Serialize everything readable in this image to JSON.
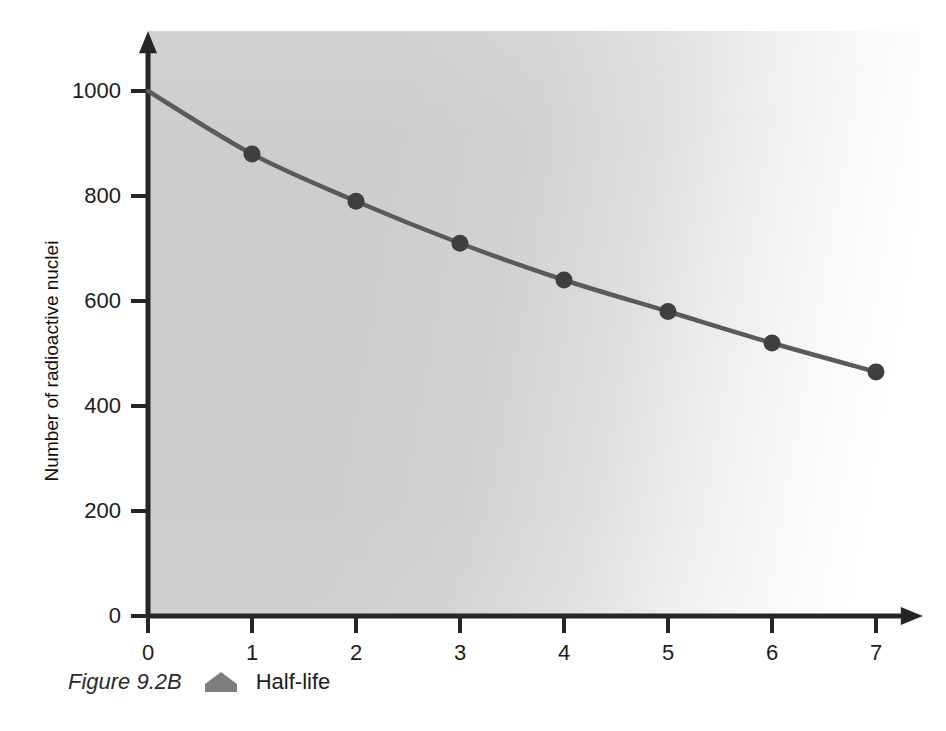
{
  "chart_data": {
    "type": "line",
    "title": "",
    "xlabel": "",
    "ylabel": "Number of radioactive nuclei",
    "x": [
      0,
      1,
      2,
      3,
      4,
      5,
      6,
      7
    ],
    "values": [
      1000,
      880,
      790,
      710,
      640,
      580,
      520,
      465
    ],
    "series": [
      {
        "name": "Half-life",
        "x": [
          0,
          1,
          2,
          3,
          4,
          5,
          6,
          7
        ],
        "values": [
          1000,
          880,
          790,
          710,
          640,
          580,
          520,
          465
        ],
        "marker_x": [
          1,
          2,
          3,
          4,
          5,
          6,
          7
        ],
        "marker_values": [
          880,
          790,
          710,
          640,
          580,
          520,
          465
        ],
        "line_color": "#5a5a5a",
        "marker_color": "#3f3f3f"
      }
    ],
    "xlim": [
      0,
      7.45
    ],
    "ylim": [
      0,
      1114
    ],
    "xticks": [
      0,
      1,
      2,
      3,
      4,
      5,
      6,
      7
    ],
    "xtick_labels": [
      "0",
      "1",
      "2",
      "3",
      "4",
      "5",
      "6",
      "7"
    ],
    "yticks": [
      0,
      200,
      400,
      600,
      800,
      1000
    ],
    "ytick_labels": [
      "0",
      "200",
      "400",
      "600",
      "800",
      "1000"
    ],
    "grid": false,
    "legend": "none",
    "axis_arrows": true,
    "plot_background": "#cdcdcd",
    "axis_color": "#262626"
  },
  "caption": {
    "figure_number": "Figure 9.2B",
    "marker_icon": "pentagon-marker-icon",
    "marker_color": "#7d7d7d",
    "label": "Half-life"
  }
}
